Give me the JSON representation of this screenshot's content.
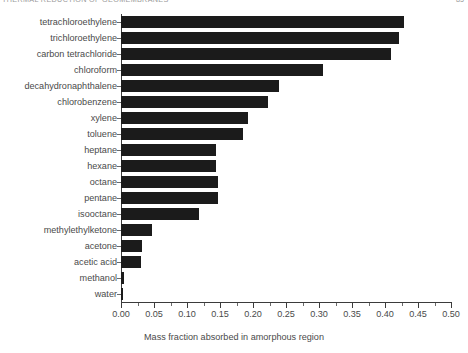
{
  "running_head": {
    "title": "THERMAL REDUCTION OF GEOMEMBRANES",
    "page": "85"
  },
  "chart_data": {
    "type": "bar",
    "orientation": "horizontal",
    "title": "",
    "xlabel": "Mass fraction absorbed in amorphous region",
    "ylabel": "",
    "xlim": [
      0.0,
      0.5
    ],
    "grid": false,
    "legend": null,
    "bar_color": "#1b1b1b",
    "xticks": [
      "0.00",
      "0.05",
      "0.10",
      "0.15",
      "0.20",
      "0.25",
      "0.30",
      "0.35",
      "0.40",
      "0.45",
      "0.50"
    ],
    "xtick_values": [
      0.0,
      0.05,
      0.1,
      0.15,
      0.2,
      0.25,
      0.3,
      0.35,
      0.4,
      0.45,
      0.5
    ],
    "categories": [
      "tetrachloroethylene",
      "trichloroethylene",
      "carbon tetrachloride",
      "chloroform",
      "decahydronaphthalene",
      "chlorobenzene",
      "xylene",
      "toluene",
      "heptane",
      "hexane",
      "octane",
      "pentane",
      "isooctane",
      "methylethylketone",
      "acetone",
      "acetic acid",
      "methanol",
      "water"
    ],
    "values": [
      0.429,
      0.421,
      0.409,
      0.306,
      0.239,
      0.223,
      0.192,
      0.185,
      0.144,
      0.144,
      0.147,
      0.147,
      0.118,
      0.047,
      0.032,
      0.03,
      0.004,
      0.003
    ]
  }
}
